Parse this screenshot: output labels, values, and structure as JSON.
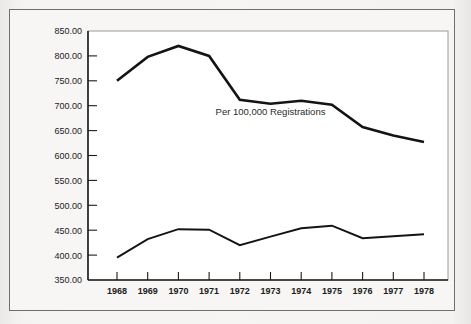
{
  "chart_data": {
    "type": "line",
    "title": "",
    "subtitle": "",
    "xlabel": "",
    "ylabel": "",
    "annotation": "Per 100,000 Registrations",
    "categories": [
      "1968",
      "1969",
      "1970",
      "1971",
      "1972",
      "1973",
      "1974",
      "1975",
      "1976",
      "1977",
      "1978"
    ],
    "x": [
      1968,
      1969,
      1970,
      1971,
      1972,
      1973,
      1974,
      1975,
      1976,
      1977,
      1978
    ],
    "ylim": [
      350,
      850
    ],
    "ytick_values": [
      350,
      400,
      450,
      500,
      550,
      600,
      650,
      700,
      750,
      800,
      850
    ],
    "ytick_labels": [
      "350.00",
      "400.00",
      "450.00",
      "500.00",
      "550.00",
      "600.00",
      "650.00",
      "700.00",
      "750.00",
      "800.00",
      "850.00"
    ],
    "xtick_labels": [
      "1968",
      "1969",
      "1970",
      "1971",
      "1972",
      "1973",
      "1974",
      "1975",
      "1976",
      "1977",
      "1978"
    ],
    "grid": false,
    "legend": "none",
    "series": [
      {
        "name": "upper-series",
        "color": "#141414",
        "line_width": 2.6,
        "values": [
          750,
          798,
          820,
          800,
          712,
          704,
          710,
          702,
          657,
          640,
          627
        ]
      },
      {
        "name": "lower-series",
        "color": "#141414",
        "line_width": 1.9,
        "values": [
          395,
          432,
          452,
          451,
          420,
          437,
          454,
          459,
          434,
          438,
          442
        ]
      }
    ]
  },
  "figure": {
    "frame_color": "#6f6f6f",
    "background_color": "#f6f5f3",
    "plot_background_color": "#ffffff",
    "axis_color": "#1b1b1b"
  }
}
